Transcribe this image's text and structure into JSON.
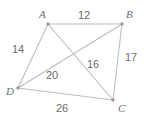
{
  "figure": {
    "background_color": "#ffffff",
    "line_color": "#bdbdbd",
    "vertex_dot_color": "#9a9a9a",
    "label_color": "#6e6e6e"
  },
  "vertices": [
    {
      "name": "A",
      "label": "A",
      "x": 48,
      "y": 24,
      "label_x": 39,
      "label_y": 9
    },
    {
      "name": "B",
      "label": "B",
      "x": 122,
      "y": 24,
      "label_x": 126,
      "label_y": 9
    },
    {
      "name": "C",
      "label": "C",
      "x": 113,
      "y": 100,
      "label_x": 118,
      "label_y": 103
    },
    {
      "name": "D",
      "label": "D",
      "x": 18,
      "y": 88,
      "label_x": 6,
      "label_y": 86
    }
  ],
  "edges": [
    {
      "name": "AB",
      "from": "A",
      "to": "B",
      "length": "12",
      "label_x": 78,
      "label_y": 10
    },
    {
      "name": "AD",
      "from": "A",
      "to": "D",
      "length": "14",
      "label_x": 12,
      "label_y": 44
    },
    {
      "name": "BC",
      "from": "B",
      "to": "C",
      "length": "17",
      "label_x": 125,
      "label_y": 52
    },
    {
      "name": "DC",
      "from": "D",
      "to": "C",
      "length": "26",
      "label_x": 56,
      "label_y": 103
    }
  ],
  "diagonals": [
    {
      "name": "AC",
      "from": "A",
      "to": "C",
      "length": "16",
      "label_x": 87,
      "label_y": 59
    },
    {
      "name": "DB",
      "from": "D",
      "to": "B",
      "length": "20",
      "label_x": 46,
      "label_y": 70
    }
  ],
  "chart_data": {
    "type": "diagram",
    "vertex_labels": [
      "A",
      "B",
      "C",
      "D"
    ],
    "segment_labels": [
      "12",
      "14",
      "17",
      "26",
      "16",
      "20"
    ],
    "segments": [
      {
        "segment": "AB",
        "value": 12
      },
      {
        "segment": "AD",
        "value": 14
      },
      {
        "segment": "BC",
        "value": 17
      },
      {
        "segment": "DC",
        "value": 26
      },
      {
        "segment": "AC",
        "value": 16
      },
      {
        "segment": "DB",
        "value": 20
      }
    ]
  }
}
